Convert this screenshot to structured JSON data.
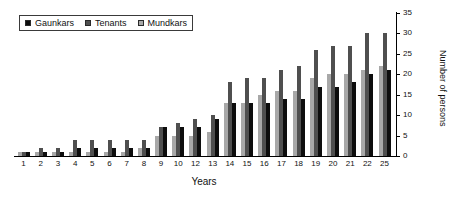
{
  "chart_data": {
    "type": "bar",
    "title": "",
    "xlabel": "Years",
    "ylabel": "Number of persons",
    "ylim": [
      0,
      35
    ],
    "yticks": [
      0,
      5,
      10,
      15,
      20,
      25,
      30,
      35
    ],
    "grid": false,
    "legend_position": "top-left",
    "categories": [
      "1",
      "2",
      "3",
      "4",
      "5",
      "6",
      "7",
      "8",
      "9",
      "10",
      "12",
      "13",
      "14",
      "15",
      "16",
      "17",
      "18",
      "19",
      "20",
      "21",
      "22",
      "25"
    ],
    "series": [
      {
        "name": "Mundkars",
        "color": "#a8a8a8",
        "values": [
          1,
          1,
          1,
          1,
          1,
          1,
          1,
          2,
          5,
          5,
          5,
          6,
          13,
          13,
          15,
          16,
          16,
          19,
          20,
          20,
          21,
          22
        ]
      },
      {
        "name": "Tenants",
        "color": "#4f4f4f",
        "values": [
          1,
          2,
          2,
          4,
          4,
          4,
          4,
          4,
          7,
          8,
          9,
          10,
          18,
          19,
          19,
          21,
          22,
          26,
          27,
          27,
          30,
          30
        ]
      },
      {
        "name": "Gaunkars",
        "color": "#0d0d0d",
        "values": [
          1,
          1,
          1,
          2,
          2,
          2,
          2,
          2,
          7,
          7,
          7,
          9,
          13,
          13,
          13,
          14,
          14,
          17,
          17,
          18,
          20,
          21
        ]
      }
    ]
  },
  "legend": {
    "entries": [
      {
        "label": "Gaunkars",
        "color": "#0d0d0d"
      },
      {
        "label": "Tenants",
        "color": "#4f4f4f"
      },
      {
        "label": "Mundkars",
        "color": "#a8a8a8"
      }
    ]
  },
  "axes": {
    "y_title": "Number of persons",
    "x_title": "Years"
  }
}
